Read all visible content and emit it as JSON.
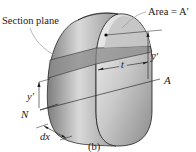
{
  "diagram": {
    "type": "mechanics-section-slice",
    "labels": {
      "section_plane": "Section plane",
      "area": "Area = A′",
      "y_bar_prime": "y̅′",
      "t": "t",
      "A": "A",
      "y_prime": "y′",
      "N": "N",
      "dx": "dx",
      "caption": "(b)"
    },
    "colors": {
      "line": "#1a1a1a",
      "body_light": "#e6e6e6",
      "body_mid": "#b5b5b5",
      "body_dark": "#8a8a8a",
      "section_fill": "#8e8e8e",
      "leader": "#9a9a9a"
    }
  }
}
